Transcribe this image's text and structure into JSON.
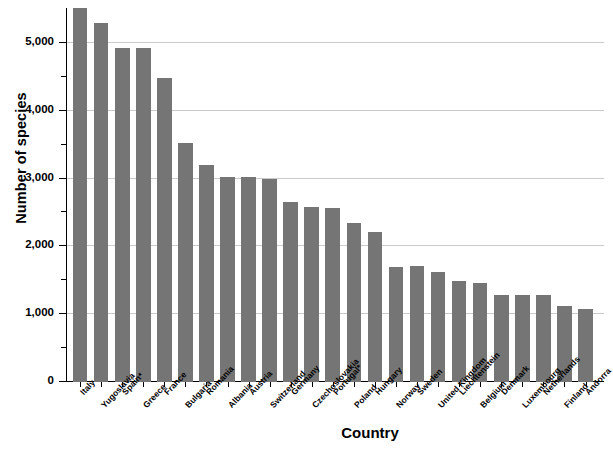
{
  "chart_data": {
    "type": "bar",
    "title": "",
    "subtitle": "",
    "xlabel": "Country",
    "ylabel": "Number of species",
    "ylim": [
      0,
      5500
    ],
    "ytick_labels": [
      "0",
      "1,000",
      "2,000",
      "3,000",
      "4,000",
      "5,000"
    ],
    "ytick_values": [
      0,
      1000,
      2000,
      3000,
      4000,
      5000
    ],
    "minor_tick_values": [
      500,
      1500,
      2500,
      3500,
      4500
    ],
    "grid": "horizontal-major-only",
    "legend": "none",
    "bar_color": "#757575",
    "categories": [
      "Italy",
      "Yugoslavia",
      "Spain*",
      "Greece",
      "France",
      "Bulgaria",
      "Romania",
      "Albania",
      "Austria",
      "Switzerland",
      "Germany",
      "Czechoslovakia",
      "Portugal*",
      "Poland",
      "Hungary",
      "Norway",
      "Sweden",
      "United Kingdom",
      "Liechtenstein",
      "Belgium",
      "Denmark",
      "Luxembourg",
      "Netherlands",
      "Finland",
      "Andorra"
    ],
    "values": [
      5520,
      5300,
      4925,
      4925,
      4490,
      3520,
      3200,
      3030,
      3020,
      3000,
      2650,
      2580,
      2570,
      2340,
      2210,
      1700,
      1710,
      1620,
      1490,
      1460,
      1290,
      1280,
      1290,
      1120,
      1080
    ]
  }
}
